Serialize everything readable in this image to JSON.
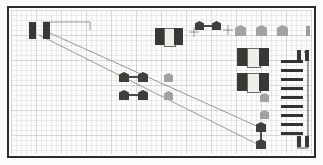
{
  "figure": {
    "background_color": "#fdfdfb",
    "frame_color": "#2e2b2a",
    "grid_color": "#8c96a0",
    "grid_minor_px": 5,
    "grid_major_px": 25,
    "dark_fill": "#3a3836",
    "mid_fill": "#6f6d6b",
    "light_fill": "#9d9d9b",
    "body_fill": "#efeeea",
    "guide_line_color": "#6b6866"
  },
  "guide_lines": [
    {
      "name": "guide-line-upper",
      "x1": 34,
      "y1": 22,
      "x2": 252,
      "y2": 120
    },
    {
      "name": "guide-line-lower",
      "x1": 30,
      "y1": 27,
      "x2": 252,
      "y2": 138
    },
    {
      "name": "bracket-top",
      "x1": 34,
      "y1": 14,
      "x2": 81,
      "y2": 14
    },
    {
      "name": "bracket-drop",
      "x1": 81,
      "y1": 14,
      "x2": 81,
      "y2": 22
    },
    {
      "name": "callout-cross-a",
      "x1": 180,
      "y1": 24,
      "x2": 190,
      "y2": 24
    },
    {
      "name": "callout-cross-b",
      "x1": 185,
      "y1": 19,
      "x2": 185,
      "y2": 29
    },
    {
      "name": "callout-cross-c",
      "x1": 214,
      "y1": 22,
      "x2": 224,
      "y2": 22
    },
    {
      "name": "callout-cross-d",
      "x1": 219,
      "y1": 17,
      "x2": 219,
      "y2": 27
    },
    {
      "name": "rack-spine",
      "x1": 299,
      "y1": 44,
      "x2": 299,
      "y2": 140
    }
  ],
  "units": {
    "top_left_pair": {
      "label": "origin-unit",
      "blocks": [
        {
          "x": 20,
          "y": 14,
          "w": 7,
          "h": 17
        },
        {
          "x": 34,
          "y": 14,
          "w": 7,
          "h": 17
        }
      ]
    },
    "top_center_vehicle": {
      "label": "vehicle-top-center",
      "cap_left": {
        "x": 146,
        "y": 20,
        "w": 9,
        "h": 17
      },
      "body": {
        "x": 155,
        "y": 20,
        "w": 10,
        "h": 17
      },
      "cap_right": {
        "x": 165,
        "y": 20,
        "w": 9,
        "h": 17
      }
    },
    "top_dumbbell": {
      "label": "dumbbell-top",
      "left": {
        "x": 186,
        "y": 13,
        "w": 9,
        "h": 9
      },
      "right": {
        "x": 203,
        "y": 13,
        "w": 9,
        "h": 9
      },
      "bar": {
        "x": 195,
        "y": 17,
        "w": 8,
        "h": 2
      }
    },
    "right_vehicle_upper": {
      "label": "vehicle-right-upper",
      "cap_left": {
        "x": 228,
        "y": 40,
        "w": 10,
        "h": 18
      },
      "body": {
        "x": 238,
        "y": 40,
        "w": 12,
        "h": 18
      },
      "cap_right": {
        "x": 250,
        "y": 40,
        "w": 10,
        "h": 18
      }
    },
    "right_vehicle_lower": {
      "label": "vehicle-right-lower",
      "cap_left": {
        "x": 228,
        "y": 65,
        "w": 10,
        "h": 18
      },
      "body": {
        "x": 238,
        "y": 65,
        "w": 12,
        "h": 18
      },
      "cap_right": {
        "x": 250,
        "y": 65,
        "w": 10,
        "h": 18
      }
    },
    "center_dumbbell_upper": {
      "label": "dumbbell-center-upper",
      "left": {
        "x": 110,
        "y": 64,
        "w": 10,
        "h": 10
      },
      "right": {
        "x": 129,
        "y": 64,
        "w": 10,
        "h": 10
      },
      "bar": {
        "x": 120,
        "y": 68,
        "w": 9,
        "h": 2
      }
    },
    "center_dumbbell_lower": {
      "label": "dumbbell-center-lower",
      "left": {
        "x": 110,
        "y": 82,
        "w": 10,
        "h": 10
      },
      "right": {
        "x": 129,
        "y": 82,
        "w": 10,
        "h": 10
      },
      "bar": {
        "x": 120,
        "y": 86,
        "w": 9,
        "h": 2
      }
    },
    "bottom_dumbbell_vertical": {
      "label": "dumbbell-bottom-vertical",
      "top": {
        "x": 247,
        "y": 114,
        "w": 10,
        "h": 10
      },
      "bottom": {
        "x": 247,
        "y": 131,
        "w": 10,
        "h": 10
      },
      "bar": {
        "x": 251,
        "y": 124,
        "w": 2,
        "h": 8
      }
    },
    "top_right_tab": {
      "label": "tab-top-right",
      "x": 297,
      "y": 18,
      "w": 4,
      "h": 10
    },
    "rack_top_pair": {
      "label": "rack-marker-top",
      "blocks": [
        {
          "x": 288,
          "y": 42,
          "w": 4,
          "h": 11
        },
        {
          "x": 296,
          "y": 42,
          "w": 4,
          "h": 11
        }
      ]
    },
    "rack_bottom_pair": {
      "label": "rack-marker-bottom",
      "blocks": [
        {
          "x": 288,
          "y": 128,
          "w": 4,
          "h": 11
        },
        {
          "x": 296,
          "y": 128,
          "w": 4,
          "h": 11
        }
      ]
    }
  },
  "pentagons": [
    {
      "name": "pentagon-top-1",
      "x": 226,
      "y": 17,
      "w": 11,
      "h": 11,
      "shade": "light"
    },
    {
      "name": "pentagon-top-2",
      "x": 247,
      "y": 17,
      "w": 11,
      "h": 11,
      "shade": "light"
    },
    {
      "name": "pentagon-top-3",
      "x": 268,
      "y": 17,
      "w": 11,
      "h": 11,
      "shade": "light"
    },
    {
      "name": "pentagon-mid-left-1",
      "x": 155,
      "y": 65,
      "w": 9,
      "h": 9,
      "shade": "light"
    },
    {
      "name": "pentagon-mid-left-2",
      "x": 155,
      "y": 83,
      "w": 9,
      "h": 9,
      "shade": "light"
    },
    {
      "name": "pentagon-right-1",
      "x": 251,
      "y": 85,
      "w": 9,
      "h": 9,
      "shade": "light"
    },
    {
      "name": "pentagon-right-2",
      "x": 251,
      "y": 102,
      "w": 9,
      "h": 9,
      "shade": "light"
    }
  ],
  "ladder": {
    "name": "rack-ladder",
    "x": 272,
    "y_start": 52,
    "rung_width": 22,
    "rung_height": 3,
    "rung_spacing": 9,
    "rung_count": 9,
    "color": "#343230"
  }
}
